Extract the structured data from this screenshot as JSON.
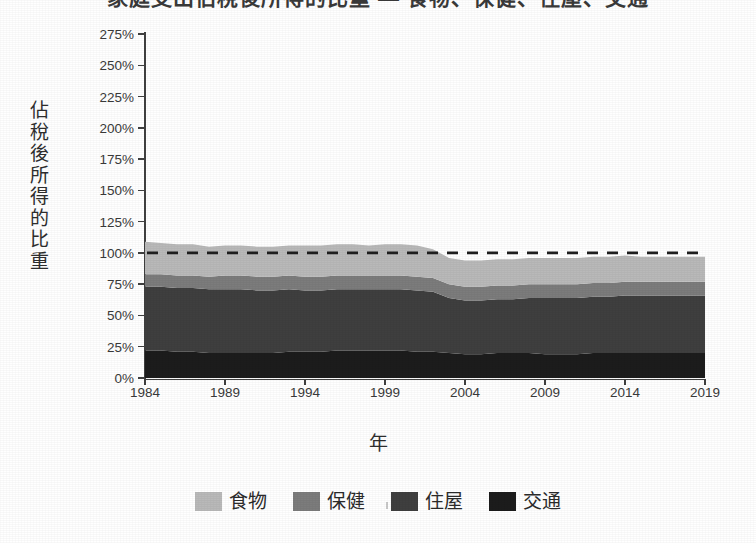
{
  "title": "家庭支出佔稅後所得的比重 — 食物、保健、住屋、交通",
  "axis": {
    "y_label_chars": [
      "佔",
      "稅",
      "後",
      "所",
      "得",
      "的",
      "比",
      "重"
    ],
    "y_label": "佔稅後所得的比重",
    "x_label": "年"
  },
  "legend": {
    "items": [
      {
        "label": "食物",
        "color": "#b9b9b9"
      },
      {
        "label": "保健",
        "color": "#7c7c7c"
      },
      {
        "label": "住屋",
        "color": "#3f3f3f"
      },
      {
        "label": "交通",
        "color": "#1c1c1c"
      }
    ]
  },
  "reference_line": {
    "label": "100%",
    "value": 100,
    "style": "dashed",
    "color": "#1f1f1f"
  },
  "chart_data": {
    "type": "area",
    "stacked": true,
    "title": "家庭支出佔稅後所得的比重 — 食物、保健、住屋、交通",
    "xlabel": "年",
    "ylabel": "佔稅後所得的比重",
    "xlim": [
      1984,
      2019
    ],
    "ylim": [
      0,
      275
    ],
    "ytick_labels": [
      "0%",
      "25%",
      "50%",
      "75%",
      "100%",
      "125%",
      "150%",
      "175%",
      "200%",
      "225%",
      "250%",
      "275%"
    ],
    "ytick_values": [
      0,
      25,
      50,
      75,
      100,
      125,
      150,
      175,
      200,
      225,
      250,
      275
    ],
    "xtick_labels": [
      "1984",
      "1989",
      "1994",
      "1999",
      "2004",
      "2009",
      "2014",
      "2019"
    ],
    "xtick_values": [
      1984,
      1989,
      1994,
      1999,
      2004,
      2009,
      2014,
      2019
    ],
    "grid": false,
    "legend_position": "bottom",
    "annotations": [
      {
        "type": "hline",
        "value": 100,
        "label": "100%",
        "style": "dashed"
      }
    ],
    "x": [
      1984,
      1985,
      1986,
      1987,
      1988,
      1989,
      1990,
      1991,
      1992,
      1993,
      1994,
      1995,
      1996,
      1997,
      1998,
      1999,
      2000,
      2001,
      2002,
      2003,
      2004,
      2005,
      2006,
      2007,
      2008,
      2009,
      2010,
      2011,
      2012,
      2013,
      2014,
      2015,
      2016,
      2017,
      2018,
      2019
    ],
    "series": [
      {
        "name": "交通",
        "color": "#1c1c1c",
        "values": [
          22,
          22,
          21,
          21,
          20,
          20,
          20,
          20,
          20,
          21,
          21,
          21,
          22,
          22,
          22,
          22,
          22,
          21,
          21,
          20,
          19,
          19,
          20,
          20,
          20,
          19,
          19,
          19,
          20,
          20,
          20,
          20,
          20,
          20,
          20,
          20
        ]
      },
      {
        "name": "住屋",
        "color": "#3f3f3f",
        "values": [
          51,
          51,
          51,
          51,
          51,
          51,
          51,
          50,
          50,
          50,
          49,
          49,
          49,
          49,
          49,
          49,
          49,
          49,
          48,
          44,
          43,
          43,
          43,
          43,
          44,
          45,
          45,
          45,
          45,
          45,
          46,
          46,
          46,
          46,
          46,
          46
        ]
      },
      {
        "name": "保健",
        "color": "#7c7c7c",
        "values": [
          10,
          10,
          10,
          10,
          10,
          11,
          11,
          11,
          11,
          11,
          11,
          11,
          11,
          11,
          11,
          11,
          11,
          11,
          11,
          11,
          11,
          11,
          11,
          11,
          11,
          11,
          11,
          11,
          11,
          11,
          11,
          11,
          11,
          11,
          11,
          11
        ]
      },
      {
        "name": "食物",
        "color": "#b9b9b9",
        "values": [
          26,
          25,
          25,
          25,
          24,
          24,
          24,
          24,
          24,
          24,
          25,
          25,
          25,
          25,
          24,
          25,
          25,
          25,
          23,
          21,
          21,
          21,
          21,
          21,
          21,
          21,
          21,
          21,
          21,
          21,
          21,
          20,
          20,
          20,
          20,
          20
        ]
      }
    ],
    "totals": [
      109,
      108,
      107,
      107,
      105,
      106,
      106,
      105,
      105,
      106,
      106,
      106,
      107,
      107,
      106,
      107,
      107,
      106,
      103,
      96,
      94,
      94,
      95,
      95,
      96,
      96,
      96,
      96,
      97,
      97,
      98,
      97,
      97,
      97,
      97,
      97
    ]
  }
}
